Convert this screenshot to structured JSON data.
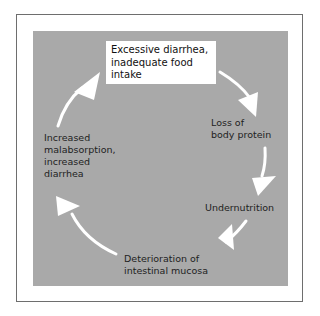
{
  "diagram": {
    "type": "cycle",
    "nodes": [
      {
        "id": "n1",
        "label": "Excessive diarrhea,\ninadequate food\nintake",
        "highlighted": true
      },
      {
        "id": "n2",
        "label": "Loss of\nbody protein"
      },
      {
        "id": "n3",
        "label": "Undernutrition"
      },
      {
        "id": "n4",
        "label": "Deterioration of\nintestinal mucosa"
      },
      {
        "id": "n5",
        "label": "Increased\nmalabsorption,\nincreased\ndiarrhea"
      }
    ],
    "edges": [
      {
        "from": "n1",
        "to": "n2"
      },
      {
        "from": "n2",
        "to": "n3"
      },
      {
        "from": "n3",
        "to": "n4"
      },
      {
        "from": "n4",
        "to": "n5"
      },
      {
        "from": "n5",
        "to": "n1"
      }
    ],
    "colors": {
      "panel": "#a9a9a9",
      "arrow": "#ffffff",
      "highlight_box": "#ffffff"
    }
  }
}
